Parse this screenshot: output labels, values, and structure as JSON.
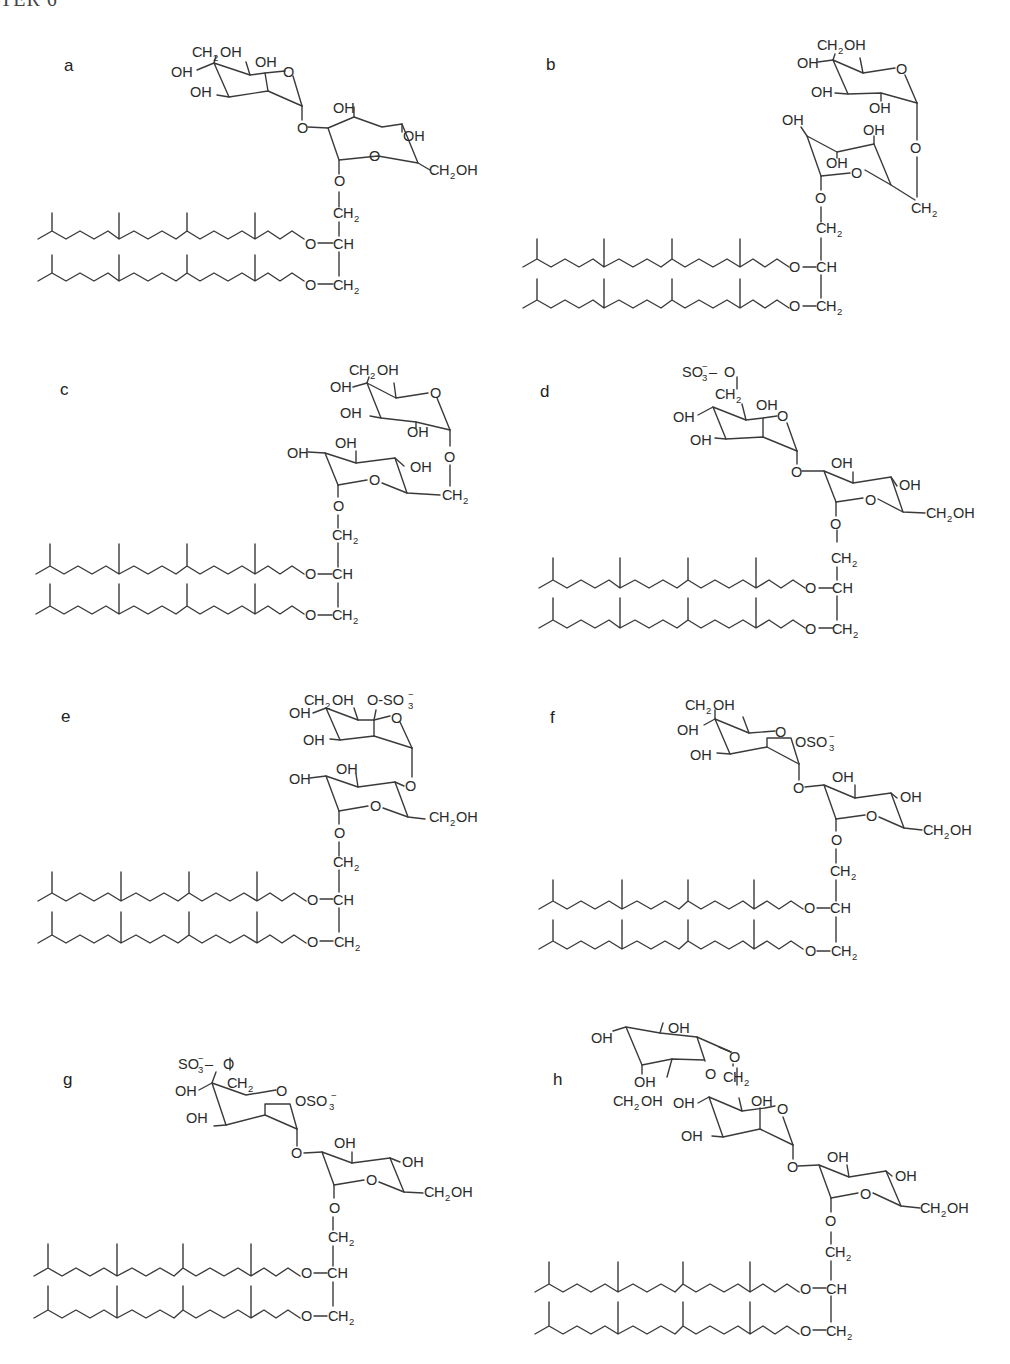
{
  "header": {
    "text": "TER 6"
  },
  "figure": {
    "panels": [
      {
        "id": "a",
        "label": "a",
        "lipid_core": "archaeol (two phytanyl chains, ether-linked to glycerol)",
        "glycerol_labels": [
          "O",
          "CH2",
          "O–CH",
          "O–CH2"
        ],
        "sugar_labels": [
          "CH2OH",
          "OH",
          "OH",
          "OH",
          "O",
          "O",
          "OH",
          "OH",
          "O",
          "CH2OH"
        ],
        "head_group": "disaccharide (hexose-α-1,2-hexose)"
      },
      {
        "id": "b",
        "label": "b",
        "lipid_core": "archaeol",
        "glycerol_labels": [
          "O",
          "CH2",
          "O–CH",
          "O–CH2"
        ],
        "sugar_labels": [
          "CH2OH",
          "OH",
          "OH",
          "OH",
          "O",
          "O",
          "OH",
          "OH",
          "OH",
          "O",
          "CH2"
        ],
        "head_group": "disaccharide (1,6-linked, furanose-type lower ring)"
      },
      {
        "id": "c",
        "label": "c",
        "lipid_core": "archaeol",
        "glycerol_labels": [
          "O",
          "CH2",
          "O–CH",
          "O–CH2"
        ],
        "sugar_labels": [
          "CH2OH",
          "OH",
          "OH",
          "OH",
          "O",
          "O",
          "OH",
          "OH",
          "OH",
          "O",
          "CH2"
        ],
        "head_group": "disaccharide (hexose-α-1,6-hexose)"
      },
      {
        "id": "d",
        "label": "d",
        "lipid_core": "archaeol",
        "glycerol_labels": [
          "O",
          "CH2",
          "O–CH",
          "O–CH2"
        ],
        "sugar_labels": [
          "SO3⁻–O",
          "CH2",
          "OH",
          "OH",
          "OH",
          "O",
          "O",
          "OH",
          "OH",
          "O",
          "CH2OH"
        ],
        "head_group": "6-sulfo disaccharide"
      },
      {
        "id": "e",
        "label": "e",
        "lipid_core": "archaeol",
        "glycerol_labels": [
          "O",
          "CH2",
          "O–CH",
          "O–CH2"
        ],
        "sugar_labels": [
          "CH2OH",
          "O-SO3⁻",
          "OH",
          "OH",
          "O",
          "OH",
          "OH",
          "O",
          "O",
          "CH2OH"
        ],
        "head_group": "2-sulfo disaccharide"
      },
      {
        "id": "f",
        "label": "f",
        "lipid_core": "archaeol",
        "glycerol_labels": [
          "O",
          "CH2",
          "O–CH",
          "O–CH2"
        ],
        "sugar_labels": [
          "CH2OH",
          "OH",
          "OH",
          "O",
          "OSO3⁻",
          "O",
          "OH",
          "OH",
          "O",
          "CH2OH"
        ],
        "head_group": "2-sulfo disaccharide (alternate configuration)"
      },
      {
        "id": "g",
        "label": "g",
        "lipid_core": "archaeol",
        "glycerol_labels": [
          "O",
          "CH2",
          "O–CH",
          "O–CH2"
        ],
        "sugar_labels": [
          "SO3⁻–O",
          "CH2",
          "OH",
          "OH",
          "O",
          "OSO3⁻",
          "O",
          "OH",
          "OH",
          "O",
          "CH2OH"
        ],
        "head_group": "2,6-disulfo disaccharide"
      },
      {
        "id": "h",
        "label": "h",
        "lipid_core": "archaeol",
        "glycerol_labels": [
          "O",
          "CH2",
          "O–CH",
          "O–CH2"
        ],
        "sugar_labels": [
          "OH",
          "OH",
          "O",
          "O",
          "OH",
          "CH2OH",
          "CH2",
          "OH",
          "OH",
          "OH",
          "O",
          "O",
          "OH",
          "OH",
          "O",
          "CH2OH"
        ],
        "head_group": "trisaccharide"
      }
    ]
  },
  "text": {
    "O": "O",
    "OH": "OH",
    "CH": "CH",
    "C": "C",
    "H": "H",
    "CH_": "CH",
    "sub2": "2",
    "sub3": "3",
    "minus": "–",
    "SO": "SO",
    "OSO": "OSO",
    "OdashSO": "O-SO",
    "neg": "−",
    "dash": "–",
    "labels": {
      "a": "a",
      "b": "b",
      "c": "c",
      "d": "d",
      "e": "e",
      "f": "f",
      "g": "g",
      "h": "h"
    }
  },
  "colors": {
    "ink": "#2a2a2a",
    "bond": "#3a3a3a",
    "background": "#ffffff"
  }
}
